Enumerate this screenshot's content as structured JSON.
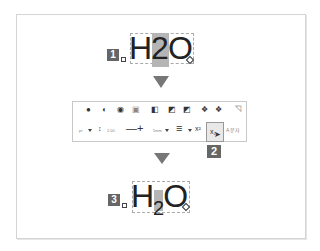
{
  "step1": {
    "badge": "1",
    "formula_before": "H",
    "formula_highlight": "2",
    "formula_after": "O"
  },
  "toolbar": {
    "row1_icons": [
      "shape-fill-icon",
      "shape-outline-icon",
      "shape-effects-icon",
      "text-box-icon",
      "bring-forward-icon",
      "send-backward-icon",
      "group-icon",
      "align-left-icon",
      "align-center-icon",
      "edit-icon"
    ],
    "unit_value": "pt",
    "spacing_value": "2.00",
    "line_width_value": "5mm",
    "selected_button": "subscript-button",
    "last_label": "A 문자"
  },
  "step2": {
    "badge": "2"
  },
  "step3": {
    "badge": "3",
    "formula_before": "H",
    "formula_sub": "2",
    "formula_after": "O"
  },
  "colors": {
    "badge_bg": "#666666",
    "highlight": "#b5b5b5",
    "arrow": "#777777"
  }
}
